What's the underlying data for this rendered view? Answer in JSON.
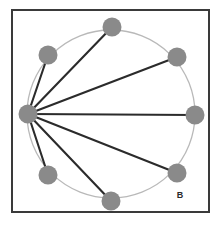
{
  "figure": {
    "panel_label": "B",
    "label_position": {
      "x": 180,
      "y": 196
    },
    "width": 222,
    "height": 231,
    "background_color": "#ffffff"
  },
  "frame": {
    "x": 12,
    "y": 10,
    "width": 197,
    "height": 202,
    "stroke_color": "#3a3a3a",
    "stroke_width": 2,
    "fill_color": "#ffffff"
  },
  "chart_data": {
    "type": "diagram",
    "title": "",
    "subtitle": "",
    "xlabel": "",
    "ylabel": "",
    "layout": "circular",
    "circle": {
      "center_x": 111,
      "center_y": 114,
      "radius": 84,
      "stroke_color": "#b9b9b9",
      "stroke_width": 1.3
    },
    "node_style": {
      "fill_color": "#8a8a8a",
      "radius": 9.5
    },
    "edge_style": {
      "stroke_color": "#2b2b2b",
      "stroke_width": 2.1
    },
    "hub_id": "n0",
    "nodes": [
      {
        "id": "n0",
        "label": "",
        "angle_deg": 180,
        "x": 28,
        "y": 114
      },
      {
        "id": "n1",
        "label": "",
        "angle_deg": 225,
        "x": 48,
        "y": 55
      },
      {
        "id": "n2",
        "label": "",
        "angle_deg": 270,
        "x": 112,
        "y": 27
      },
      {
        "id": "n3",
        "label": "",
        "angle_deg": 315,
        "x": 177,
        "y": 57
      },
      {
        "id": "n4",
        "label": "",
        "angle_deg": 0,
        "x": 195,
        "y": 115
      },
      {
        "id": "n5",
        "label": "",
        "angle_deg": 45,
        "x": 177,
        "y": 173
      },
      {
        "id": "n6",
        "label": "",
        "angle_deg": 90,
        "x": 111,
        "y": 201
      },
      {
        "id": "n7",
        "label": "",
        "angle_deg": 135,
        "x": 48,
        "y": 175
      }
    ],
    "edges": [
      {
        "source": "n0",
        "target": "n1"
      },
      {
        "source": "n0",
        "target": "n2"
      },
      {
        "source": "n0",
        "target": "n3"
      },
      {
        "source": "n0",
        "target": "n4"
      },
      {
        "source": "n0",
        "target": "n5"
      },
      {
        "source": "n0",
        "target": "n6"
      },
      {
        "source": "n0",
        "target": "n7"
      }
    ],
    "node_count": 8,
    "edge_count": 7
  }
}
